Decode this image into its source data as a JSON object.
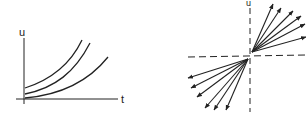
{
  "left_diagram": {
    "y_axis_label": "u",
    "x_axis_label": "t",
    "curves": [
      {
        "name": "curve-1",
        "path": "M25,88 C50,80 70,65 82,40"
      },
      {
        "name": "curve-2",
        "path": "M25,94 C55,88 75,72 90,43"
      },
      {
        "name": "curve-3",
        "path": "M25,98 C60,95 88,82 108,57"
      }
    ]
  },
  "right_diagram": {
    "y_axis_label": "u",
    "origin": [
      251,
      55
    ],
    "arrows_upper_right": [
      [
        273,
        4
      ],
      [
        281,
        8
      ],
      [
        293,
        11
      ],
      [
        301,
        16
      ],
      [
        305,
        24
      ],
      [
        306,
        37
      ]
    ],
    "arrows_lower_left": [
      [
        188,
        78
      ],
      [
        191,
        88
      ],
      [
        197,
        97
      ],
      [
        205,
        108
      ],
      [
        214,
        110
      ],
      [
        226,
        110
      ]
    ]
  },
  "colors": {
    "line": "#222222",
    "background": "#ffffff"
  }
}
